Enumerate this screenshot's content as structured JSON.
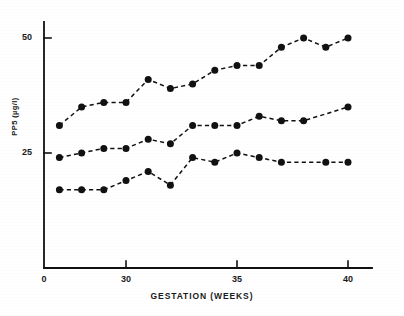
{
  "chart_data": {
    "type": "line",
    "title": "",
    "subtitle": "",
    "xlabel": "GESTATION  (WEEKS)",
    "ylabel": "PP5 (µg/l)",
    "xlim": [
      25.3,
      41.0
    ],
    "ylim": [
      0,
      54
    ],
    "xticks": [
      0,
      30,
      35,
      40
    ],
    "xticklabels": [
      "0",
      "30",
      "35",
      "40"
    ],
    "yticks": [
      25,
      50
    ],
    "yticklabels": [
      "25",
      "50"
    ],
    "grid": false,
    "legend": "none",
    "linestyle": "dashed",
    "marker": "filled-circle",
    "x": [
      27,
      28,
      29,
      30,
      31,
      32,
      33,
      34,
      35,
      36,
      37,
      38,
      39,
      40
    ],
    "series": [
      {
        "name": "upper",
        "values": [
          31,
          35,
          36,
          36,
          41,
          39,
          40,
          43,
          44,
          44,
          48,
          50,
          48,
          50
        ]
      },
      {
        "name": "median",
        "values": [
          24,
          25,
          26,
          26,
          28,
          27,
          31,
          31,
          31,
          33,
          32,
          32,
          35
        ],
        "x": [
          27,
          28,
          29,
          30,
          31,
          32,
          33,
          34,
          35,
          36,
          37,
          38,
          40
        ]
      },
      {
        "name": "lower",
        "values": [
          17,
          17,
          17,
          19,
          21,
          18,
          24,
          23,
          25,
          24,
          23,
          23,
          23
        ],
        "x": [
          27,
          28,
          29,
          30,
          31,
          32,
          33,
          34,
          35,
          36,
          37,
          39,
          40
        ]
      }
    ]
  },
  "axes": {
    "x_title": "GESTATION  (WEEKS)",
    "y_title": "PP5 (µg/l)",
    "x_tick_0": "0",
    "x_tick_30": "30",
    "x_tick_35": "35",
    "x_tick_40": "40",
    "y_tick_25": "25",
    "y_tick_50": "50"
  },
  "colors": {
    "ink": "#111111",
    "background": "#ffffff"
  }
}
